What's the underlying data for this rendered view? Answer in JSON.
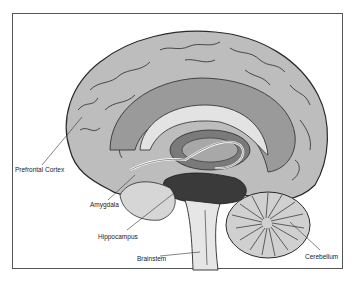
{
  "diagram": {
    "labels": [
      {
        "id": "prefrontal-cortex",
        "text": "Prefrontal Cortex"
      },
      {
        "id": "amygdala",
        "text": "Amygdala"
      },
      {
        "id": "hippocampus",
        "text": "Hippocampus"
      },
      {
        "id": "brainstem",
        "text": "Brainstem"
      },
      {
        "id": "cerebellum",
        "text": "Cerebellum"
      }
    ],
    "colors": {
      "cortex": "#bdbdbd",
      "cortex_light": "#d6d6d6",
      "inner": "#9a9a9a",
      "deep": "#7a7a7a",
      "dark": "#3a3a3a",
      "outline": "#2a2a2a",
      "frame": "#555555"
    }
  }
}
